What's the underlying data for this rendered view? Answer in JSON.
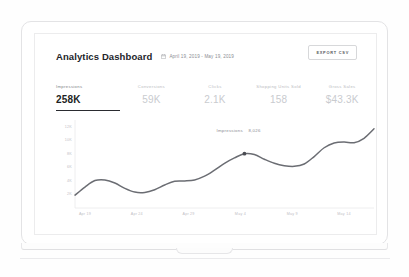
{
  "header": {
    "title": "Analytics Dashboard",
    "date_range": "April 19, 2019 - May 19, 2019",
    "calendar_icon": "calendar-icon",
    "export_label": "EXPORT CSV"
  },
  "metrics": [
    {
      "label": "Impressions",
      "value": "258K",
      "active": true
    },
    {
      "label": "Conversions",
      "value": "59K",
      "active": false
    },
    {
      "label": "Clicks",
      "value": "2.1K",
      "active": false
    },
    {
      "label": "Shopping Units Sold",
      "value": "158",
      "active": false
    },
    {
      "label": "Gross Sales",
      "value": "$43.3K",
      "active": false
    }
  ],
  "tooltip": {
    "label": "Impressions",
    "value": "8,026"
  },
  "chart_data": {
    "type": "line",
    "title": "",
    "xlabel": "",
    "ylabel": "",
    "grid": false,
    "legend": "none",
    "series_name": "Impressions",
    "line_color": "#6b6d73",
    "ylim": [
      0,
      13000
    ],
    "ytick_labels": [
      "12K",
      "10K",
      "8K",
      "6K",
      "4K",
      "2K"
    ],
    "ytick_values": [
      12000,
      10000,
      8000,
      6000,
      4000,
      2000
    ],
    "xtick_labels": [
      "Apr 19",
      "Apr 24",
      "Apr 29",
      "May 4",
      "May 9",
      "May 14"
    ],
    "x": [
      "Apr 19",
      "Apr 20",
      "Apr 21",
      "Apr 22",
      "Apr 23",
      "Apr 24",
      "Apr 25",
      "Apr 26",
      "Apr 27",
      "Apr 28",
      "Apr 29",
      "Apr 30",
      "May 1",
      "May 2",
      "May 3",
      "May 4",
      "May 5",
      "May 6",
      "May 7",
      "May 8",
      "May 9",
      "May 10",
      "May 11",
      "May 12",
      "May 13",
      "May 14",
      "May 15",
      "May 16",
      "May 17",
      "May 18",
      "May 19"
    ],
    "values": [
      1900,
      3100,
      4050,
      4150,
      3700,
      2900,
      2350,
      2300,
      2700,
      3400,
      3950,
      4000,
      4150,
      4700,
      5600,
      6600,
      7400,
      8026,
      7900,
      7200,
      6600,
      6250,
      6150,
      6500,
      7600,
      8900,
      9600,
      9750,
      9650,
      10300,
      11700
    ],
    "highlight_point": {
      "x": "May 6",
      "y": 8026
    }
  }
}
